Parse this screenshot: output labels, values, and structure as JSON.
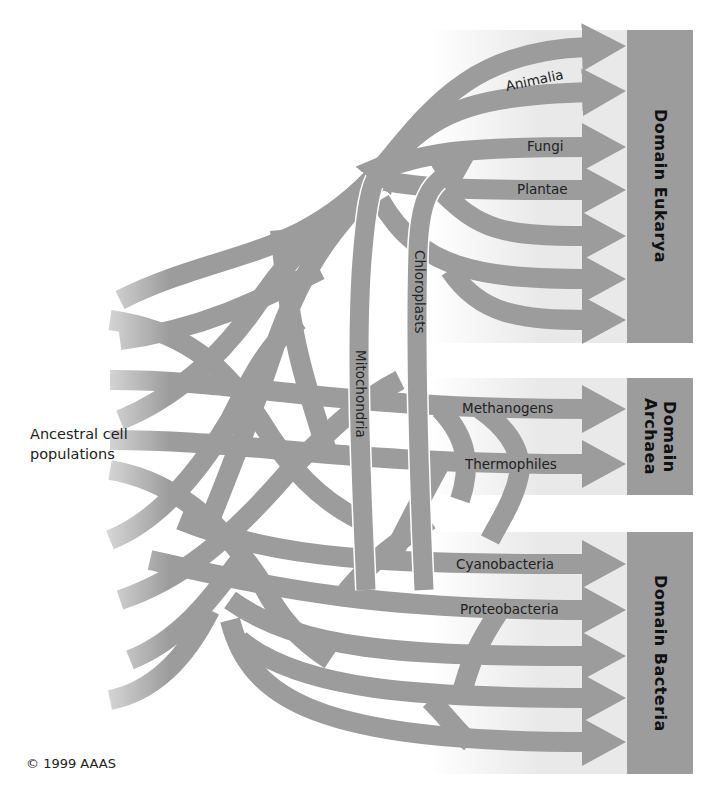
{
  "diagram": {
    "colors": {
      "branch": "#9c9c9c",
      "panel": "#e9e9e9",
      "domain_box": "#9c9c9c",
      "text": "#222222",
      "background": "#ffffff"
    },
    "domains": [
      {
        "id": "eukarya",
        "label": "Domain Eukarya",
        "arrows": 7,
        "lineages": [
          "Animalia",
          "Fungi",
          "Plantae"
        ]
      },
      {
        "id": "archaea",
        "label": "Domain\nArchaea",
        "label_line1": "Domain",
        "label_line2": "Archaea",
        "arrows": 2,
        "lineages": [
          "Methanogens",
          "Thermophiles"
        ]
      },
      {
        "id": "bacteria",
        "label": "Domain Bacteria",
        "arrows": 5,
        "lineages": [
          "Cyanobacteria",
          "Proteobacteria"
        ]
      }
    ],
    "endosymbiosis": {
      "mitochondria": "Mitochondria",
      "chloroplasts": "Chloroplasts"
    },
    "ancestral_label_line1": "Ancestral cell",
    "ancestral_label_line2": "populations",
    "copyright": "© 1999 AAAS"
  }
}
